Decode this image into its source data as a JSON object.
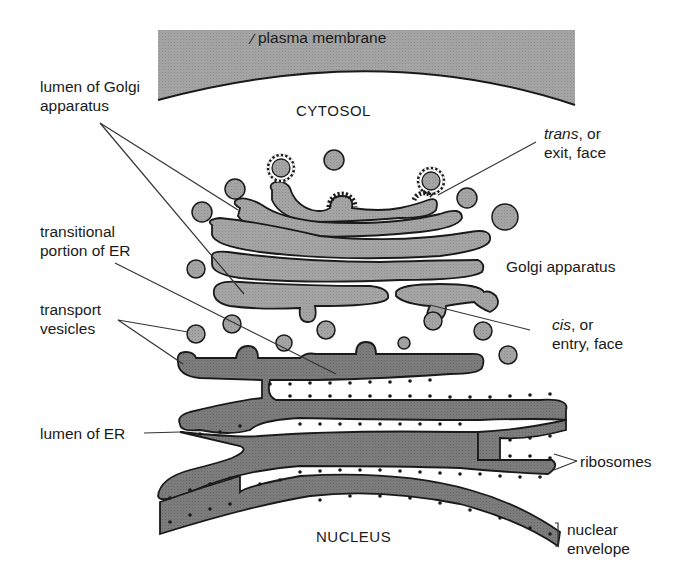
{
  "figure": {
    "type": "cell biology diagram"
  },
  "regions": {
    "cytosol": "CYTOSOL",
    "nucleus": "NUCLEUS"
  },
  "labels": {
    "plasma_membrane": "plasma membrane",
    "lumen_golgi_line1": "lumen of Golgi",
    "lumen_golgi_line2": "apparatus",
    "trans_italic": "trans",
    "trans_rest": ", or",
    "trans_line2": "exit, face",
    "transitional_line1": "transitional",
    "transitional_line2": "portion of ER",
    "golgi_apparatus": "Golgi apparatus",
    "transport_line1": "transport",
    "transport_line2": "vesicles",
    "cis_italic": "cis",
    "cis_rest": ", or",
    "cis_line2": "entry, face",
    "lumen_er": "lumen of ER",
    "ribosomes": "ribosomes",
    "nuclear_line1": "nuclear",
    "nuclear_line2": "envelope"
  },
  "colors": {
    "membrane_fill": "#a0a0a0",
    "golgi_fill": "#a3a3a3",
    "er_fill": "#7a7a7a",
    "outline": "#1a1a1a",
    "background": "#ffffff"
  }
}
